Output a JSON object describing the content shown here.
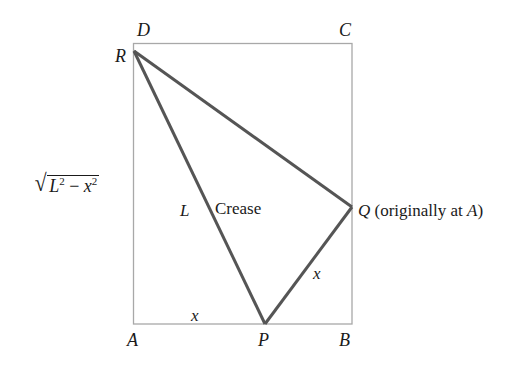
{
  "figure": {
    "colors": {
      "rectangle_stroke": "#a8a8a8",
      "fold_stroke": "#555555",
      "text": "#1a1a1a"
    },
    "rectangle": {
      "corners": [
        "A",
        "B",
        "C",
        "D"
      ]
    },
    "fold_triangle": {
      "vertices": [
        "R",
        "P",
        "Q"
      ]
    },
    "points": {
      "D": "D",
      "C": "C",
      "R": "R",
      "A": "A",
      "P": "P",
      "B": "B",
      "Q": "Q"
    },
    "labels": {
      "q_note_prefix": " (originally at ",
      "q_note_point": "A",
      "q_note_suffix": ")",
      "crease": "Crease",
      "hypotenuse": "L",
      "ap_segment": "x",
      "pq_segment": "x",
      "side_expr": {
        "radical": "√",
        "L": "L",
        "exp1": "2",
        "minus": " − ",
        "x": "x",
        "exp2": "2"
      }
    }
  }
}
